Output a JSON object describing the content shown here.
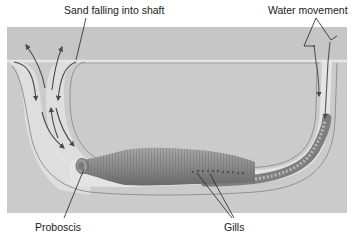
{
  "labels": {
    "sand_falling": "Sand falling into shaft",
    "water_movement": "Water movement",
    "proboscis": "Proboscis",
    "gills": "Gills"
  },
  "colors": {
    "background": "#ffffff",
    "sediment": "#c9c9c9",
    "sediment_top": "#c4c4c4",
    "burrow_wall": "#e4e4e4",
    "burrow_outline": "#8a8a8a",
    "worm_body": "#8f8f8f",
    "worm_dark": "#6e6e6e",
    "arrow": "#555555",
    "leader_line": "#222222"
  }
}
